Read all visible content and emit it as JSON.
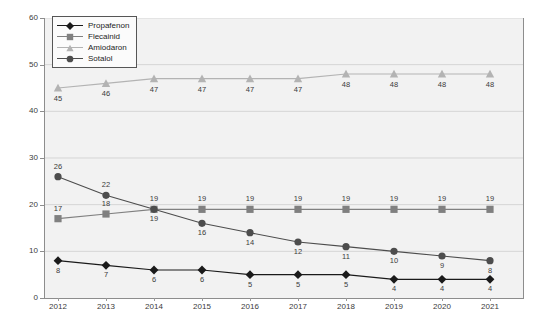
{
  "chart_data": {
    "type": "line",
    "title": "",
    "xlabel": "",
    "ylabel": "(Mio. DDD)",
    "categories": [
      "2012",
      "2013",
      "2014",
      "2015",
      "2016",
      "2017",
      "2018",
      "2019",
      "2020",
      "2021"
    ],
    "ylim": [
      0,
      60
    ],
    "yticks": [
      "0",
      "10",
      "20",
      "30",
      "40",
      "50",
      "60"
    ],
    "grid": "horizontal",
    "legend_position": "top-left-inside",
    "series": [
      {
        "name": "Propafenon",
        "marker": "diamond",
        "color": "#1a1a1a",
        "values": [
          8,
          7,
          6,
          6,
          5,
          5,
          5,
          4,
          4,
          4
        ]
      },
      {
        "name": "Flecainid",
        "marker": "square",
        "color": "#808080",
        "values": [
          17,
          18,
          19,
          19,
          19,
          19,
          19,
          19,
          19,
          19
        ]
      },
      {
        "name": "Amiodaron",
        "marker": "triangle",
        "color": "#b3b3b3",
        "values": [
          45,
          46,
          47,
          47,
          47,
          47,
          48,
          48,
          48,
          48
        ]
      },
      {
        "name": "Sotalol",
        "marker": "circle",
        "color": "#4d4d4d",
        "values": [
          26,
          22,
          19,
          16,
          14,
          12,
          11,
          10,
          9,
          8
        ]
      }
    ]
  },
  "legend": {
    "items": [
      {
        "label": "Propafenon"
      },
      {
        "label": "Flecainid"
      },
      {
        "label": "Amiodaron"
      },
      {
        "label": "Sotalol"
      }
    ]
  },
  "axes": {
    "y_title": "(Mio. DDD)",
    "y_ticks": [
      "60",
      "50",
      "40",
      "30",
      "20",
      "10",
      "0"
    ],
    "x_ticks": [
      "2012",
      "2013",
      "2014",
      "2015",
      "2016",
      "2017",
      "2018",
      "2019",
      "2020",
      "2021"
    ]
  },
  "colors": {
    "plot_background": "#f2f2f2",
    "gridline": "#d5d5d5",
    "axis": "#8d8d8d",
    "text": "#3b3b3b"
  }
}
